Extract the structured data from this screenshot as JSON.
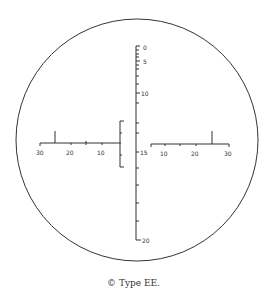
{
  "caption": "© Type EE.",
  "reticle": {
    "vertical_scale": {
      "labels": [
        "0",
        "5",
        "10",
        "15",
        "20"
      ]
    },
    "left_scale": {
      "labels": [
        "30",
        "20",
        "10"
      ]
    },
    "right_scale": {
      "labels": [
        "15",
        "10",
        "20",
        "30"
      ]
    }
  },
  "colors": {
    "line": "#333333",
    "background": "#ffffff"
  }
}
